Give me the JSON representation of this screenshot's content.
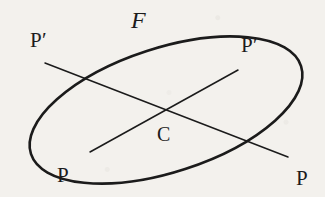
{
  "figure": {
    "type": "geometry-diagram",
    "background_color": "#f3f1ed",
    "stroke_color": "#1b1b1b",
    "ellipse": {
      "label": "F",
      "center": {
        "x": 166,
        "y": 110
      },
      "semi_major": 142,
      "semi_minor": 62,
      "rotation_deg": -18,
      "stroke_width": 2.6
    },
    "chords": [
      {
        "name": "chord-upper-left-to-lower-right",
        "from": {
          "label": "P'",
          "x": 45,
          "y": 63
        },
        "to": {
          "label": "P",
          "x": 288,
          "y": 157
        },
        "stroke_width": 1.5
      },
      {
        "name": "chord-lower-left-to-upper-right",
        "from": {
          "label": "P",
          "x": 90,
          "y": 152
        },
        "to": {
          "label": "P'",
          "x": 238,
          "y": 70
        },
        "stroke_width": 1.5
      }
    ],
    "labels": {
      "curve": {
        "text": "F",
        "x": 131,
        "y": 8
      },
      "point_top_left": {
        "text": "P′",
        "x": 30,
        "y": 30
      },
      "point_top_right": {
        "text": "P′",
        "x": 241,
        "y": 35
      },
      "point_bottom_left": {
        "text": "P",
        "x": 57,
        "y": 165
      },
      "point_bottom_right": {
        "text": "P",
        "x": 296,
        "y": 168
      },
      "center": {
        "text": "C",
        "x": 157,
        "y": 124
      }
    }
  }
}
